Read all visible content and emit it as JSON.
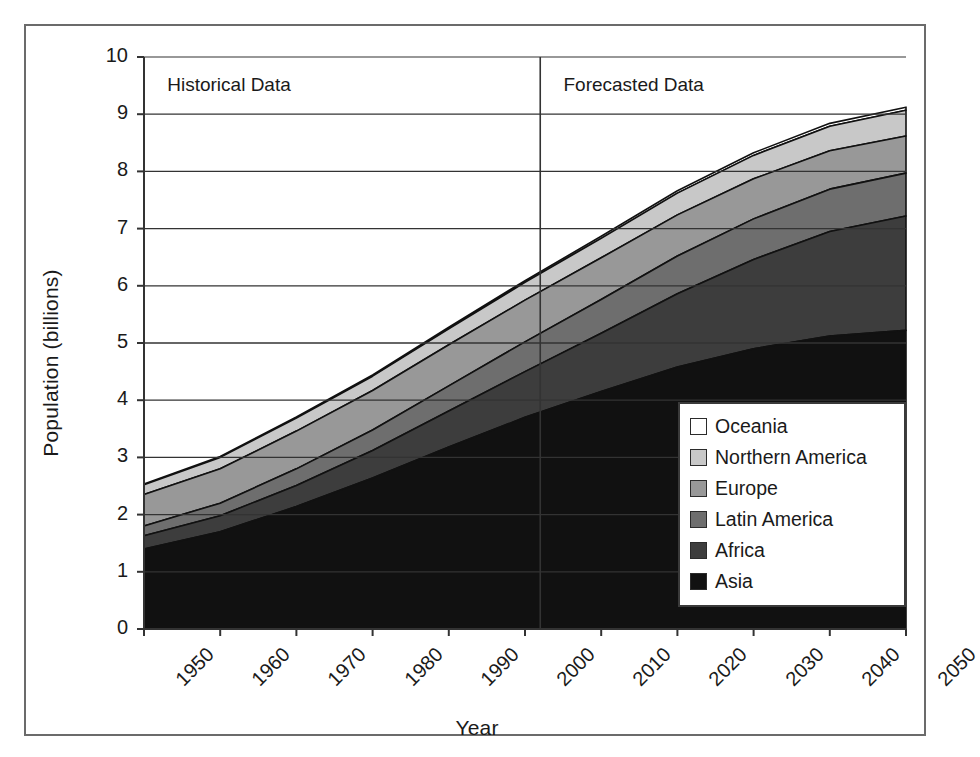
{
  "chart_data": {
    "type": "area",
    "title": "",
    "subtitle": "",
    "xlabel": "Year",
    "ylabel": "Population (billions)",
    "xlim": [
      1950,
      2050
    ],
    "ylim": [
      0,
      10
    ],
    "ytick_labels": [
      "0",
      "1",
      "2",
      "3",
      "4",
      "5",
      "6",
      "7",
      "8",
      "9",
      "10"
    ],
    "ytick_values": [
      0,
      1,
      2,
      3,
      4,
      5,
      6,
      7,
      8,
      9,
      10
    ],
    "xtick_labels": [
      "1950",
      "1960",
      "1970",
      "1980",
      "1990",
      "2000",
      "2010",
      "2020",
      "2030",
      "2040",
      "2050"
    ],
    "xtick_values": [
      1950,
      1960,
      1970,
      1980,
      1990,
      2000,
      2010,
      2020,
      2030,
      2040,
      2050
    ],
    "grid": "horizontal",
    "legend_position": "lower-right",
    "stacked": true,
    "stack_order_bottom_to_top": [
      "Asia",
      "Africa",
      "Latin America",
      "Europe",
      "Northern America",
      "Oceania"
    ],
    "x": [
      1950,
      1960,
      1970,
      1980,
      1990,
      2000,
      2010,
      2020,
      2030,
      2040,
      2050
    ],
    "series": [
      {
        "name": "Asia",
        "color": "#111111",
        "values": [
          1.4,
          1.7,
          2.14,
          2.64,
          3.18,
          3.7,
          4.15,
          4.58,
          4.9,
          5.12,
          5.22
        ]
      },
      {
        "name": "Africa",
        "color": "#3d3d3d",
        "values": [
          0.23,
          0.28,
          0.37,
          0.48,
          0.63,
          0.8,
          1.02,
          1.28,
          1.56,
          1.83,
          2.0
        ]
      },
      {
        "name": "Latin America",
        "color": "#6e6e6e",
        "values": [
          0.17,
          0.22,
          0.29,
          0.36,
          0.44,
          0.52,
          0.59,
          0.66,
          0.71,
          0.74,
          0.75
        ]
      },
      {
        "name": "Europe",
        "color": "#989898",
        "values": [
          0.55,
          0.6,
          0.66,
          0.69,
          0.72,
          0.73,
          0.73,
          0.72,
          0.7,
          0.67,
          0.65
        ]
      },
      {
        "name": "Northern America",
        "color": "#c8c8c8",
        "values": [
          0.17,
          0.2,
          0.23,
          0.25,
          0.28,
          0.31,
          0.34,
          0.38,
          0.41,
          0.43,
          0.45
        ]
      },
      {
        "name": "Oceania",
        "color": "#ffffff",
        "values": [
          0.013,
          0.016,
          0.019,
          0.023,
          0.027,
          0.031,
          0.036,
          0.041,
          0.046,
          0.05,
          0.053
        ]
      }
    ],
    "totals": [
      2.53,
      3.02,
      3.71,
      4.44,
      5.28,
      6.09,
      6.87,
      7.66,
      8.33,
      8.84,
      9.13
    ],
    "annotations": [
      {
        "text": "Historical Data",
        "x": 1952,
        "y": 9.5
      },
      {
        "text": "Forecasted Data",
        "x": 2004,
        "y": 9.5
      }
    ],
    "divider": {
      "x": 2002,
      "label": "historical-forecast-divider"
    }
  },
  "legend": {
    "items": [
      {
        "label": "Oceania",
        "color": "#ffffff"
      },
      {
        "label": "Northern America",
        "color": "#c8c8c8"
      },
      {
        "label": "Europe",
        "color": "#989898"
      },
      {
        "label": "Latin America",
        "color": "#6e6e6e"
      },
      {
        "label": "Africa",
        "color": "#3d3d3d"
      },
      {
        "label": "Asia",
        "color": "#111111"
      }
    ]
  },
  "colors": {
    "frame": "#6b6b6b",
    "axis": "#333333",
    "grid": "#333333",
    "text": "#1a1a1a",
    "background": "#ffffff"
  }
}
